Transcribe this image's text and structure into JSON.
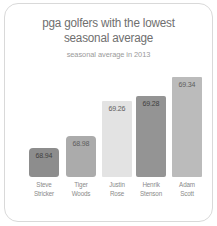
{
  "chart_data": {
    "type": "bar",
    "title": "pga golfers with the lowest seasonal average",
    "title_lines": [
      "pga golfers with the lowest",
      "seasonal average"
    ],
    "subtitle": "seasonal average in 2013",
    "xlabel": "",
    "ylabel": "",
    "grid": false,
    "legend": "none",
    "ylim": [
      68.8,
      69.4
    ],
    "categories": [
      "Steve Stricker",
      "Tiger Woods",
      "Justin Rose",
      "Henrik Stenson",
      "Adam Scott"
    ],
    "category_lines": [
      [
        "Steve",
        "Stricker"
      ],
      [
        "Tiger",
        "Woods"
      ],
      [
        "Justin",
        "Rose"
      ],
      [
        "Henrik",
        "Stenson"
      ],
      [
        "Adam",
        "Scott"
      ]
    ],
    "values": [
      68.94,
      68.98,
      69.26,
      69.28,
      69.34
    ],
    "value_labels": [
      "68.94",
      "68.98",
      "69.26",
      "69.28",
      "69.34"
    ],
    "bar_colors": [
      "#8d8d8d",
      "#ababab",
      "#e3e3e3",
      "#949494",
      "#bbbbbb"
    ]
  },
  "card": {
    "background": "#ffffff",
    "border_color": "#d9d9d9"
  },
  "colors": {
    "title": "#6f6f6f",
    "subtitle": "#9a9a9a",
    "category_label": "#8a8a8a",
    "value_label": "#5d5d5d"
  }
}
